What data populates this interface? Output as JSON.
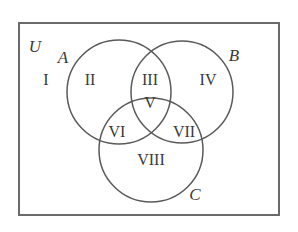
{
  "diagram": {
    "type": "venn-3-set",
    "colors": {
      "stroke": "#5a5a5a",
      "frame": "#6a6a6a",
      "text": "#3a3a3a",
      "background": "#ffffff"
    },
    "universe": {
      "label": "U",
      "x": 19,
      "y": 23,
      "width": 260,
      "height": 192
    },
    "sets": [
      {
        "id": "A",
        "label": "A",
        "cx": 119,
        "cy": 92,
        "r": 52,
        "label_x": 63,
        "label_y": 63
      },
      {
        "id": "B",
        "label": "B",
        "cx": 182,
        "cy": 92,
        "r": 51,
        "label_x": 234,
        "label_y": 61
      },
      {
        "id": "C",
        "label": "C",
        "cx": 151,
        "cy": 150,
        "r": 52,
        "label_x": 195,
        "label_y": 200
      }
    ],
    "regions": [
      {
        "id": "I",
        "label": "I",
        "x": 46,
        "y": 85
      },
      {
        "id": "II",
        "label": "II",
        "x": 90,
        "y": 85
      },
      {
        "id": "III",
        "label": "III",
        "x": 150,
        "y": 85
      },
      {
        "id": "IV",
        "label": "IV",
        "x": 208,
        "y": 85
      },
      {
        "id": "V",
        "label": "V",
        "x": 150,
        "y": 108
      },
      {
        "id": "VI",
        "label": "VI",
        "x": 117,
        "y": 137
      },
      {
        "id": "VII",
        "label": "VII",
        "x": 184,
        "y": 137
      },
      {
        "id": "VIII",
        "label": "VIII",
        "x": 151,
        "y": 165
      }
    ],
    "universe_label": {
      "text": "U",
      "x": 35,
      "y": 52
    }
  }
}
